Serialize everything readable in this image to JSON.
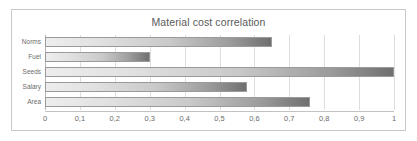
{
  "chart_data": {
    "type": "bar",
    "orientation": "horizontal",
    "title": "Material cost correlation",
    "xlabel": "",
    "ylabel": "",
    "categories": [
      "Norms",
      "Fuel",
      "Seeds",
      "Salary",
      "Area"
    ],
    "values": [
      0.65,
      0.3,
      1.0,
      0.58,
      0.76
    ],
    "xlim": [
      0,
      1
    ],
    "xticks": [
      0,
      0.1,
      0.2,
      0.3,
      0.4,
      0.5,
      0.6,
      0.7,
      0.8,
      0.9,
      1
    ],
    "xtick_labels": [
      "0",
      "0,1",
      "0,2",
      "0,3",
      "0,4",
      "0,5",
      "0,6",
      "0,7",
      "0,8",
      "0,9",
      "1"
    ],
    "grid": true,
    "legend": false,
    "bar_color": "#9b9b9b",
    "bar_border_color": "#9a9a9a",
    "gridline_color": "#dededf",
    "title_color": "#5a5a5a",
    "label_color": "#6b6b6b",
    "frame_border_color": "#c9c9c9",
    "background": "#ffffff"
  }
}
